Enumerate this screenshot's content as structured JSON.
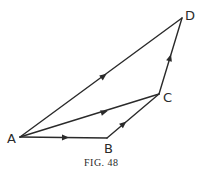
{
  "figure": {
    "caption": "Fig. 48",
    "caption_display": "FIG. 48"
  },
  "points": {
    "A": {
      "label": "A",
      "x": 20,
      "y": 137
    },
    "B": {
      "label": "B",
      "x": 107,
      "y": 138
    },
    "C": {
      "label": "C",
      "x": 159,
      "y": 94
    },
    "D": {
      "label": "D",
      "x": 182,
      "y": 18
    }
  },
  "vectors": [
    {
      "from": "A",
      "to": "B"
    },
    {
      "from": "B",
      "to": "C"
    },
    {
      "from": "C",
      "to": "D"
    },
    {
      "from": "A",
      "to": "C"
    },
    {
      "from": "A",
      "to": "D"
    }
  ],
  "colors": {
    "stroke": "#2a2a2a",
    "background": "#ffffff"
  }
}
